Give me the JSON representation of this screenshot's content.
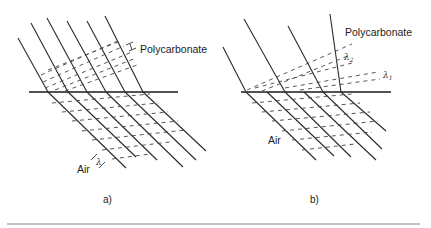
{
  "figure": {
    "panels": [
      {
        "id": "a",
        "caption": "a)",
        "upper_medium_label": "Polycarbonate",
        "lower_medium_label": "Air",
        "wavelength_symbol": "λ",
        "wavelength_symbol_upper": "λ"
      },
      {
        "id": "b",
        "caption": "b)",
        "upper_medium_label": "Polycarbonate",
        "lower_medium_label": "Air",
        "wavelength_symbol_1": "λ1",
        "wavelength_symbol_2": "λ2"
      }
    ]
  }
}
